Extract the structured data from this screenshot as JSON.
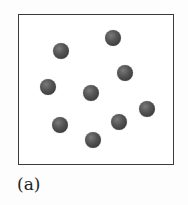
{
  "figure": {
    "caption": "(a)",
    "frame": {
      "x": 18,
      "y": 14,
      "width": 156,
      "height": 151,
      "border_color": "#3a3a3a"
    },
    "particle_color": "#4a4a4a",
    "particle_radius": 8,
    "particles": [
      {
        "x": 61,
        "y": 51
      },
      {
        "x": 113,
        "y": 38
      },
      {
        "x": 125,
        "y": 73
      },
      {
        "x": 48,
        "y": 87
      },
      {
        "x": 91,
        "y": 93
      },
      {
        "x": 147,
        "y": 109
      },
      {
        "x": 60,
        "y": 125
      },
      {
        "x": 119,
        "y": 122
      },
      {
        "x": 93,
        "y": 140
      }
    ]
  }
}
